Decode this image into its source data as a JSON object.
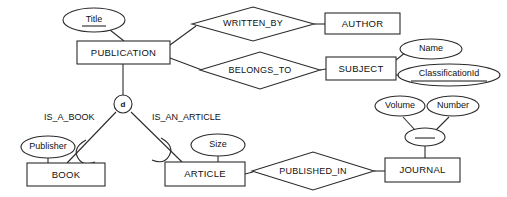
{
  "diagram": {
    "notation": "chen-er",
    "colors": {
      "stroke": "#2b2b2b",
      "fill": "#ffffff",
      "text": "#111111",
      "background": "#ffffff"
    },
    "entities": [
      {
        "id": "publication",
        "label": "PUBLICATION",
        "kind": "entity",
        "x": 77,
        "y": 41,
        "w": 93,
        "h": 23
      },
      {
        "id": "author",
        "label": "AUTHOR",
        "kind": "entity",
        "x": 325,
        "y": 13,
        "w": 75,
        "h": 21
      },
      {
        "id": "subject",
        "label": "SUBJECT",
        "kind": "entity",
        "x": 326,
        "y": 57,
        "w": 70,
        "h": 23
      },
      {
        "id": "book",
        "label": "BOOK",
        "kind": "entity-subclass",
        "x": 27,
        "y": 163,
        "w": 78,
        "h": 23
      },
      {
        "id": "article",
        "label": "ARTICLE",
        "kind": "entity-subclass",
        "x": 165,
        "y": 162,
        "w": 80,
        "h": 24
      },
      {
        "id": "journal",
        "label": "JOURNAL",
        "kind": "entity",
        "x": 385,
        "y": 158,
        "w": 75,
        "h": 24
      }
    ],
    "relationships": [
      {
        "id": "written_by",
        "label": "WRITTEN_BY",
        "cx": 253,
        "cy": 24,
        "rx": 61,
        "ry": 17
      },
      {
        "id": "belongs_to",
        "label": "BELONGS_TO",
        "cx": 260,
        "cy": 71,
        "rx": 60,
        "ry": 19
      },
      {
        "id": "published_in",
        "label": "PUBLISHED_IN",
        "cx": 313,
        "cy": 171,
        "rx": 61,
        "ry": 19
      }
    ],
    "attributes": [
      {
        "id": "title",
        "label": "Title",
        "key": true,
        "cx": 94,
        "cy": 20,
        "rx": 31,
        "ry": 12
      },
      {
        "id": "name",
        "label": "Name",
        "key": false,
        "cx": 431,
        "cy": 49,
        "rx": 31,
        "ry": 10
      },
      {
        "id": "classification_id",
        "label": "ClassificationId",
        "key": true,
        "cx": 449,
        "cy": 75,
        "rx": 51,
        "ry": 11
      },
      {
        "id": "publisher",
        "label": "Publisher",
        "key": false,
        "cx": 48,
        "cy": 147,
        "rx": 27,
        "ry": 11
      },
      {
        "id": "size",
        "label": "Size",
        "key": false,
        "cx": 218,
        "cy": 145,
        "rx": 27,
        "ry": 11
      },
      {
        "id": "volume",
        "label": "Volume",
        "key": false,
        "cx": 400,
        "cy": 106,
        "rx": 25,
        "ry": 10
      },
      {
        "id": "number",
        "label": "Number",
        "key": false,
        "cx": 453,
        "cy": 106,
        "rx": 26,
        "ry": 10
      },
      {
        "id": "journal_key",
        "label": "",
        "key": true,
        "cx": 425,
        "cy": 137,
        "rx": 20,
        "ry": 9
      }
    ],
    "specialization": {
      "id": "disjoint-circle",
      "label": "d",
      "type": "disjoint",
      "cx": 123,
      "cy": 104,
      "r": 9,
      "edge_labels": [
        {
          "id": "is_a_book",
          "label": "IS_A_BOOK",
          "x": 44,
          "y": 118
        },
        {
          "id": "is_an_article",
          "label": "IS_AN_ARTICLE",
          "x": 152,
          "y": 118
        }
      ]
    },
    "connections": [
      {
        "from": "title",
        "to": "publication"
      },
      {
        "from": "publication",
        "to": "written_by"
      },
      {
        "from": "written_by",
        "to": "author"
      },
      {
        "from": "publication",
        "to": "belongs_to"
      },
      {
        "from": "belongs_to",
        "to": "subject"
      },
      {
        "from": "subject",
        "to": "name"
      },
      {
        "from": "subject",
        "to": "classification_id"
      },
      {
        "from": "publication",
        "to": "disjoint-circle"
      },
      {
        "from": "disjoint-circle",
        "to": "book"
      },
      {
        "from": "disjoint-circle",
        "to": "article"
      },
      {
        "from": "publisher",
        "to": "book"
      },
      {
        "from": "size",
        "to": "article"
      },
      {
        "from": "article",
        "to": "published_in"
      },
      {
        "from": "published_in",
        "to": "journal"
      },
      {
        "from": "journal",
        "to": "journal_key"
      },
      {
        "from": "journal_key",
        "to": "volume"
      },
      {
        "from": "journal_key",
        "to": "number"
      }
    ]
  }
}
